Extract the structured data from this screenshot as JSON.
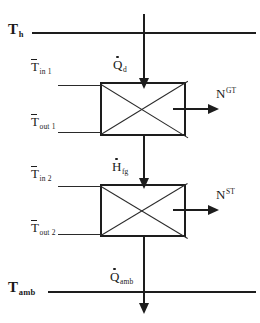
{
  "diagram": {
    "stroke_color": "#1d1d1d",
    "background": "#ffffff"
  },
  "reservoirs": {
    "hot": {
      "symbol": "T",
      "subscript": "h",
      "label": "T h"
    },
    "ambient": {
      "symbol": "T",
      "subscript": "amb",
      "label": "T amb"
    }
  },
  "flows": {
    "heat_in": {
      "symbol": "Q",
      "subscript": "d",
      "accent": "dot",
      "label": "Q d",
      "direction": "down"
    },
    "interstage": {
      "symbol": "H",
      "subscript": "fg",
      "accent": "dot",
      "label": "H fg",
      "direction": "down"
    },
    "heat_out": {
      "symbol": "Q",
      "subscript": "amb",
      "accent": "dot",
      "label": "Q amb",
      "direction": "down"
    }
  },
  "streams": [
    {
      "symbol": "T",
      "subscript": "in 1",
      "overbar": true,
      "label": "T in 1"
    },
    {
      "symbol": "T",
      "subscript": "out 1",
      "overbar": true,
      "label": "T out 1"
    },
    {
      "symbol": "T",
      "subscript": "in 2",
      "overbar": true,
      "label": "T in 2"
    },
    {
      "symbol": "T",
      "subscript": "out 2",
      "overbar": true,
      "label": "T out 2"
    }
  ],
  "blocks": [
    {
      "name": "gas-turbine-block",
      "work_symbol": "N",
      "work_superscript": "GT",
      "work_label": "N GT"
    },
    {
      "name": "steam-turbine-block",
      "work_symbol": "N",
      "work_superscript": "ST",
      "work_label": "N ST"
    }
  ]
}
